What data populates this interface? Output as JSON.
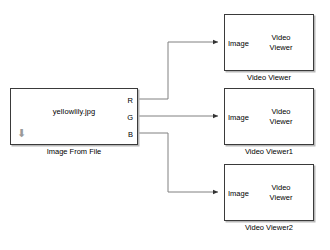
{
  "diagram": {
    "background_color": "#ffffff",
    "line_color": "#808080",
    "block_border_color": "#3a3a3a",
    "shadow_color": "#b8b8b8"
  },
  "source_block": {
    "name": "Image From File",
    "filename_value": "yellowlily.jpg",
    "caption": "Image From File",
    "icon": "down-arrow-icon",
    "ports": [
      {
        "label": "R",
        "signal": "red"
      },
      {
        "label": "G",
        "signal": "green"
      },
      {
        "label": "B",
        "signal": "blue"
      }
    ]
  },
  "viewers": [
    {
      "port_label": "Image",
      "title_line1": "Video",
      "title_line2": "Viewer",
      "caption": "Video Viewer"
    },
    {
      "port_label": "Image",
      "title_line1": "Video",
      "title_line2": "Viewer",
      "caption": "Video Viewer1"
    },
    {
      "port_label": "Image",
      "title_line1": "Video",
      "title_line2": "Viewer",
      "caption": "Video Viewer2"
    }
  ],
  "connections": [
    {
      "from": "R",
      "to": "Video Viewer"
    },
    {
      "from": "G",
      "to": "Video Viewer1"
    },
    {
      "from": "B",
      "to": "Video Viewer2"
    }
  ]
}
